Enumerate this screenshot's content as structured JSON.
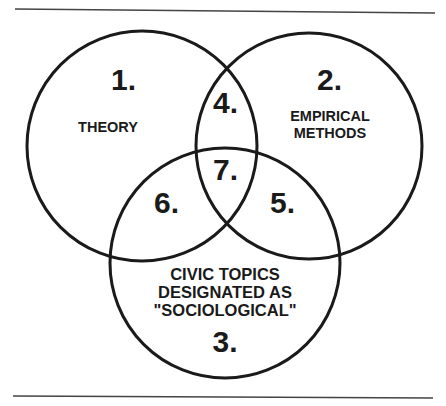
{
  "diagram": {
    "type": "venn",
    "colors": {
      "stroke": "#1a1a1a",
      "background": "#ffffff",
      "rule": "#444444"
    },
    "circles": [
      {
        "id": "1",
        "number": "1.",
        "label_lines": [
          "THEORY"
        ]
      },
      {
        "id": "2",
        "number": "2.",
        "label_lines": [
          "EMPIRICAL",
          "METHODS"
        ]
      },
      {
        "id": "3",
        "number": "3.",
        "label_lines": [
          "CIVIC TOPICS",
          "DESIGNATED AS",
          "\"SOCIOLOGICAL\""
        ]
      }
    ],
    "intersections": [
      {
        "number": "4.",
        "sets": [
          "1",
          "2"
        ]
      },
      {
        "number": "5.",
        "sets": [
          "2",
          "3"
        ]
      },
      {
        "number": "6.",
        "sets": [
          "1",
          "3"
        ]
      },
      {
        "number": "7.",
        "sets": [
          "1",
          "2",
          "3"
        ]
      }
    ]
  }
}
